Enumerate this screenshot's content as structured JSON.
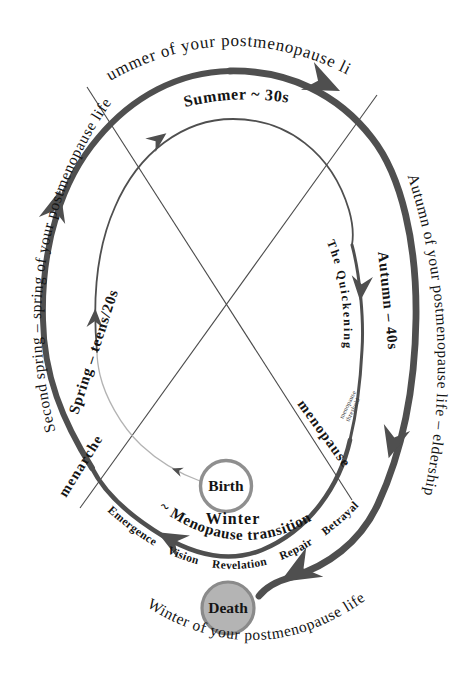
{
  "diagram_type": "life-seasons-spiral",
  "colors": {
    "background": "#ffffff",
    "arc": "#4f4f4f",
    "arc_light": "#b3b3b3",
    "text": "#141414",
    "death_fill": "#b4b4b4",
    "circle_ring": "#8f8f8f"
  },
  "outer_cycle": {
    "top": "Summer of your postmenopause life",
    "right": "Autumn of your postmenopause life – eldership",
    "left": "Second spring – spring of your postmenopause life",
    "bottom": "Winter of your postmenopause life"
  },
  "inner_cycle": {
    "spring": "Spring – teens/20s",
    "summer": "Summer ~ 30s",
    "autumn": "Autumn – 40s",
    "winter_title": "Winter",
    "winter_subtitle": "~ Menopause transition",
    "quickening": "The Quickening",
    "threshold_note": {
      "line1": "menopause",
      "line2": "threshold"
    }
  },
  "milestones": {
    "birth": "Birth",
    "death": "Death",
    "menarche": "menarche",
    "menopause": "menopause"
  },
  "menopause_phases": {
    "list": [
      "Emergence",
      "Vision",
      "Revelation",
      "Repair",
      "Betrayal"
    ],
    "display": "Emergence Vision Revelation Repair Betrayal"
  }
}
